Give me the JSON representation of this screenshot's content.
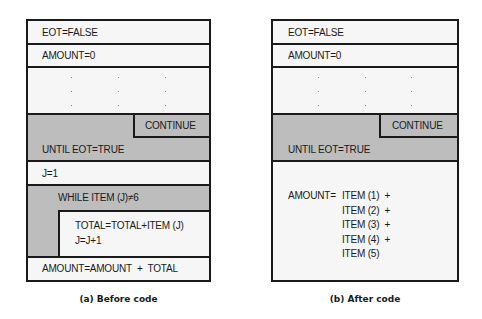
{
  "left": {
    "caption": "(a) Before code",
    "rows": {
      "eot": "EOT=FALSE",
      "amount_init": "AMOUNT=0",
      "continue": "CONTINUE",
      "until": "UNTIL EOT=TRUE",
      "j_init": "J=1",
      "while": "WHILE ITEM (J)≠6",
      "total": "TOTAL=TOTAL+ITEM (J)",
      "j_inc": "J=J+1",
      "amount_final": "AMOUNT=AMOUNT  +  TOTAL"
    }
  },
  "right": {
    "caption": "(b) After code",
    "rows": {
      "eot": "EOT=FALSE",
      "amount_init": "AMOUNT=0",
      "continue": "CONTINUE",
      "until": "UNTIL EOT=TRUE",
      "amount_label": "AMOUNT=",
      "items": [
        "ITEM (1)  +",
        "ITEM (2)  +",
        "ITEM (3)  +",
        "ITEM (4)  +",
        "ITEM (5)"
      ]
    }
  }
}
